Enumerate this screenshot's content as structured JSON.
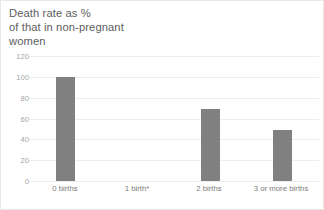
{
  "chart_data": {
    "type": "bar",
    "title": "Death rate as %\nof that in non-pregnant\nwomen",
    "title_lines": [
      "Death rate as %",
      "of that in non-pregnant",
      "women"
    ],
    "xlabel": "",
    "ylabel": "",
    "categories": [
      "0 births",
      "1 birth*",
      "2 births",
      "3 or more births"
    ],
    "values": [
      100,
      null,
      69,
      49
    ],
    "ylim": [
      0,
      120
    ],
    "yticks": [
      120,
      100,
      80,
      60,
      40,
      20,
      0
    ],
    "ytick_labels": [
      "120",
      "100",
      "80",
      "60",
      "40",
      "20",
      "0"
    ],
    "grid": true,
    "legend": false,
    "legend_position": "none",
    "bar_color": "#808080",
    "gridline_color": "#ededed",
    "title_color": "#5d5d5d",
    "tick_label_color": "#a6a6a6",
    "category_label_color": "#7d7d7d"
  },
  "footer": {
    "cutoff_text": ""
  }
}
